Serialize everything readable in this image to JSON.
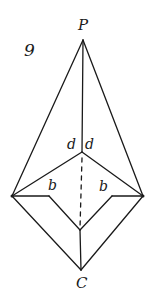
{
  "figure": {
    "number": "9",
    "stroke_color": "#1a1a1a",
    "background": "#ffffff"
  },
  "labels": {
    "apex": "P",
    "bottom": "C",
    "d_left": "d",
    "d_right": "d",
    "b_left": "b",
    "b_right": "b"
  },
  "points": {
    "P": [
      83,
      40
    ],
    "center": [
      82,
      152
    ],
    "left": [
      12,
      196
    ],
    "right": [
      143,
      196
    ],
    "b_left_corner": [
      49,
      196
    ],
    "b_right_corner": [
      112,
      196
    ],
    "inner_bottom": [
      80,
      230
    ],
    "C": [
      81,
      270
    ]
  }
}
